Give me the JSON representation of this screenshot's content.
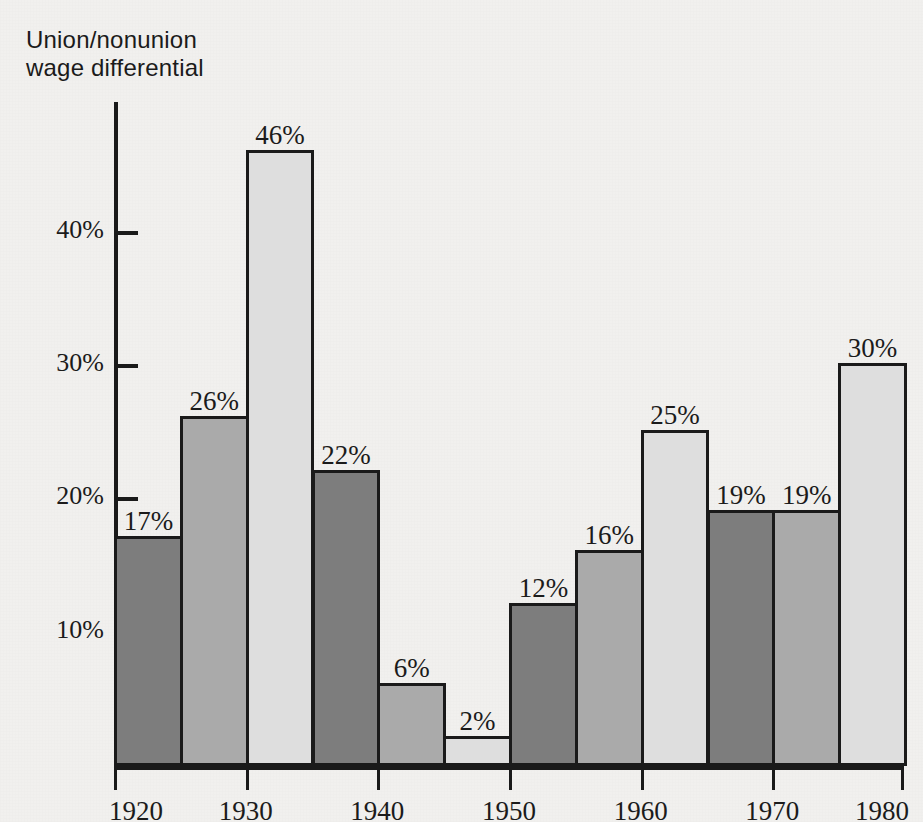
{
  "figure": {
    "background_color": "#f1f0ee",
    "axis_color": "#1a1a1a",
    "text_color": "#1b1b1b"
  },
  "axis_title": "Union/nonunion\nwage differential",
  "chart_data": {
    "type": "bar",
    "title": "",
    "subtitle": "",
    "xlabel": "",
    "ylabel": "Union/nonunion wage differential",
    "ylim": [
      0,
      50
    ],
    "xlim": [
      1920,
      1980
    ],
    "grid": false,
    "legend": null,
    "y_ticks": [
      {
        "value": 10,
        "label": "10%"
      },
      {
        "value": 20,
        "label": "20%"
      },
      {
        "value": 30,
        "label": "30%"
      },
      {
        "value": 40,
        "label": "40%"
      }
    ],
    "x_ticks": [
      {
        "value": 1920,
        "label": "1920"
      },
      {
        "value": 1930,
        "label": "1930"
      },
      {
        "value": 1940,
        "label": "1940"
      },
      {
        "value": 1950,
        "label": "1950"
      },
      {
        "value": 1960,
        "label": "1960"
      },
      {
        "value": 1970,
        "label": "1970"
      },
      {
        "value": 1980,
        "label": "1980"
      }
    ],
    "bar_shades": [
      "#7d7d7d",
      "#aaaaaa",
      "#dedede"
    ],
    "categories": [
      "1920-1925",
      "1925-1930",
      "1930-1935",
      "1935-1940",
      "1940-1945",
      "1945-1950",
      "1950-1955",
      "1955-1960",
      "1960-1965",
      "1965-1970",
      "1970-1975",
      "1975-1980"
    ],
    "values": [
      17,
      26,
      46,
      22,
      6,
      2,
      12,
      16,
      25,
      19,
      19,
      30
    ],
    "value_labels": [
      "17%",
      "26%",
      "46%",
      "22%",
      "6%",
      "2%",
      "12%",
      "16%",
      "25%",
      "19%",
      "19%",
      "30%"
    ],
    "bars": [
      {
        "label": "17%",
        "value": 17,
        "shade": "#7d7d7d",
        "x_start": 1920,
        "x_end": 1925
      },
      {
        "label": "26%",
        "value": 26,
        "shade": "#aaaaaa",
        "x_start": 1925,
        "x_end": 1930
      },
      {
        "label": "46%",
        "value": 46,
        "shade": "#dedede",
        "x_start": 1930,
        "x_end": 1935
      },
      {
        "label": "22%",
        "value": 22,
        "shade": "#7d7d7d",
        "x_start": 1935,
        "x_end": 1940
      },
      {
        "label": "6%",
        "value": 6,
        "shade": "#aaaaaa",
        "x_start": 1940,
        "x_end": 1945
      },
      {
        "label": "2%",
        "value": 2,
        "shade": "#dedede",
        "x_start": 1945,
        "x_end": 1950
      },
      {
        "label": "12%",
        "value": 12,
        "shade": "#7d7d7d",
        "x_start": 1950,
        "x_end": 1955
      },
      {
        "label": "16%",
        "value": 16,
        "shade": "#aaaaaa",
        "x_start": 1955,
        "x_end": 1960
      },
      {
        "label": "25%",
        "value": 25,
        "shade": "#dedede",
        "x_start": 1960,
        "x_end": 1965
      },
      {
        "label": "19%",
        "value": 19,
        "shade": "#7d7d7d",
        "x_start": 1965,
        "x_end": 1970
      },
      {
        "label": "19%",
        "value": 19,
        "shade": "#aaaaaa",
        "x_start": 1970,
        "x_end": 1975
      },
      {
        "label": "30%",
        "value": 30,
        "shade": "#dedede",
        "x_start": 1975,
        "x_end": 1980
      }
    ]
  }
}
